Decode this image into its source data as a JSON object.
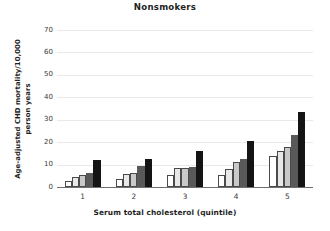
{
  "chart_data": {
    "type": "bar",
    "title": "Nonsmokers",
    "xlabel": "Serum total cholesterol (quintile)",
    "ylabel_line1": "Age-adjusted CHD mortality/10,000",
    "ylabel_line2": "person years",
    "categories": [
      "1",
      "2",
      "3",
      "4",
      "5"
    ],
    "ylim": [
      0,
      70
    ],
    "yticks": [
      0,
      10,
      20,
      30,
      40,
      50,
      60,
      70
    ],
    "ytick_labels": [
      "0",
      "10",
      "20",
      "30",
      "40",
      "50",
      "60",
      "70"
    ],
    "grid": "horizontal",
    "legend": "none",
    "series": [
      {
        "name": "series-1",
        "color": "#ffffff",
        "values": [
          2.8,
          3.7,
          5.3,
          5.5,
          14.0
        ]
      },
      {
        "name": "series-2",
        "color": "#e8e8e8",
        "values": [
          4.3,
          6.0,
          8.5,
          8.0,
          16.0
        ]
      },
      {
        "name": "series-3",
        "color": "#c9c9c9",
        "values": [
          5.2,
          6.2,
          8.7,
          11.0,
          18.0
        ]
      },
      {
        "name": "series-4",
        "color": "#595959",
        "values": [
          6.3,
          9.4,
          9.0,
          12.3,
          23.0
        ]
      },
      {
        "name": "series-5",
        "color": "#141414",
        "values": [
          12.2,
          12.6,
          16.1,
          20.6,
          33.5
        ]
      }
    ]
  }
}
